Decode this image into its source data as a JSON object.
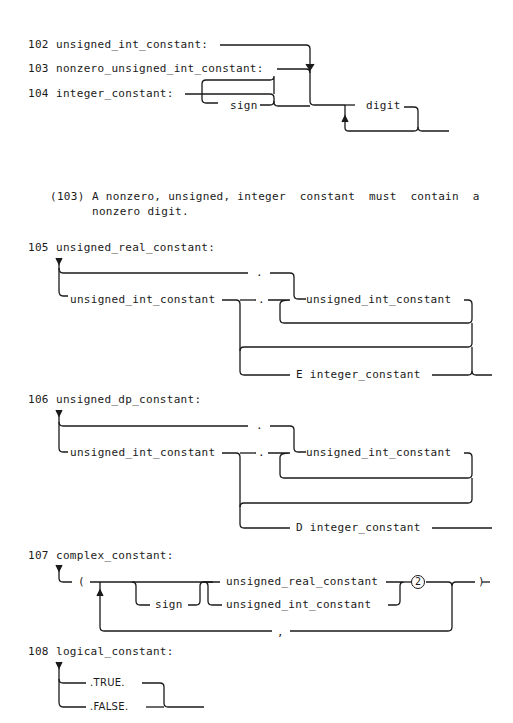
{
  "rules": {
    "r102": {
      "number": "102",
      "name": "unsigned_int_constant:"
    },
    "r103": {
      "number": "103",
      "name": "nonzero_unsigned_int_constant:"
    },
    "r104": {
      "number": "104",
      "name": "integer_constant:",
      "terms": {
        "sign": "sign",
        "digit": "digit"
      }
    },
    "note103": {
      "ref": "(103)",
      "line1": "A nonzero, unsigned, integer  constant  must  contain  a",
      "line2": "nonzero digit."
    },
    "r105": {
      "number": "105",
      "name": "unsigned_real_constant:",
      "terms": {
        "dot_top": ".",
        "int1": "unsigned_int_constant",
        "dot_mid": ".",
        "int2": "unsigned_int_constant",
        "exp": "E integer_constant"
      }
    },
    "r106": {
      "number": "106",
      "name": "unsigned_dp_constant:",
      "terms": {
        "dot_top": ".",
        "int1": "unsigned_int_constant",
        "dot_mid": ".",
        "int2": "unsigned_int_constant",
        "exp": "D integer_constant"
      }
    },
    "r107": {
      "number": "107",
      "name": "complex_constant:",
      "terms": {
        "lparen": "(",
        "sign": "sign",
        "real": "unsigned_real_constant",
        "int": "unsigned_int_constant",
        "note": "2",
        "rparen": ")",
        "comma": ","
      }
    },
    "r108": {
      "number": "108",
      "name": "logical_constant:",
      "terms": {
        "true": ".TRUE.",
        "false": ".FALSE."
      }
    }
  }
}
